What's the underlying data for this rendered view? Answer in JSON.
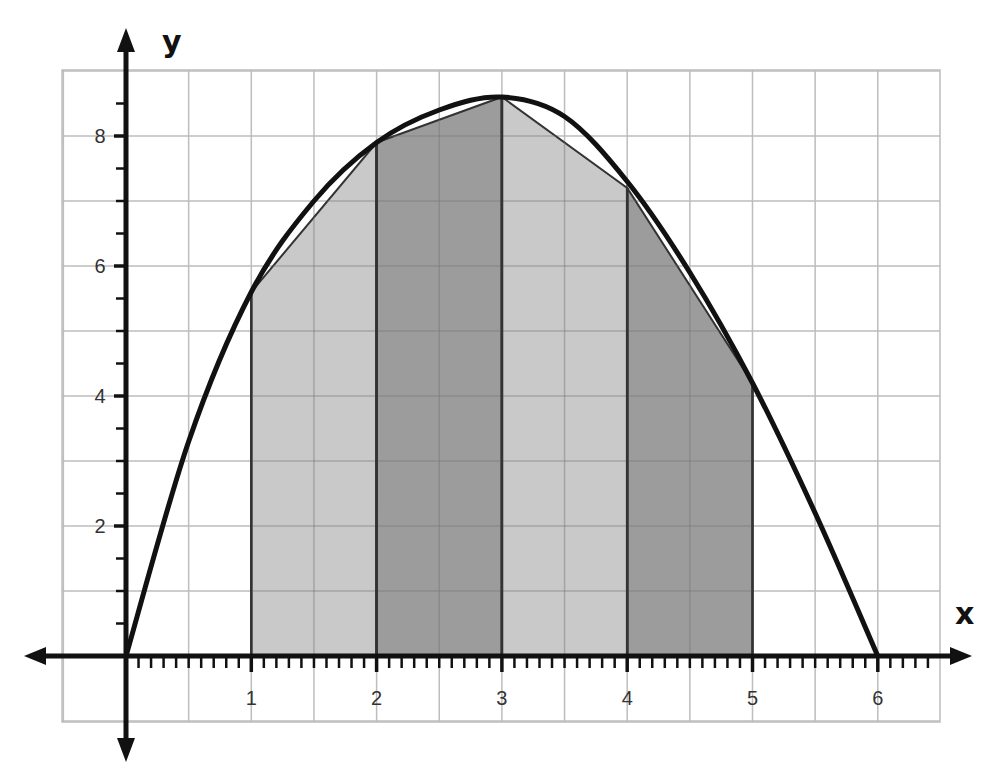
{
  "chart_data": {
    "type": "area",
    "title": "",
    "xlabel": "x",
    "ylabel": "y",
    "xlim": [
      -0.5,
      6.5
    ],
    "ylim": [
      -1,
      8.9
    ],
    "x_ticks": [
      1,
      2,
      3,
      4,
      5,
      6
    ],
    "y_ticks": [
      2,
      4,
      6,
      8
    ],
    "x_tick_labels": [
      "1",
      "2",
      "3",
      "4",
      "5",
      "6"
    ],
    "y_tick_labels": [
      "2",
      "4",
      "6",
      "8"
    ],
    "grid": true,
    "grid_spacing": {
      "x": 0.5,
      "y": 1
    },
    "minor_ticks": {
      "x": 0.1,
      "y": 0.5
    },
    "curve": {
      "name": "f(x)",
      "x": [
        0,
        0.5,
        1,
        1.5,
        2,
        2.5,
        3,
        3.5,
        4,
        4.5,
        5,
        5.5,
        6
      ],
      "y": [
        0,
        3.3,
        5.6,
        7.0,
        7.9,
        8.4,
        8.6,
        8.3,
        7.3,
        5.9,
        4.2,
        2.2,
        0
      ]
    },
    "trapezoids": [
      {
        "x0": 1,
        "x1": 2,
        "y0": 5.6,
        "y1": 7.9,
        "shade": "light"
      },
      {
        "x0": 2,
        "x1": 3,
        "y0": 7.9,
        "y1": 8.6,
        "shade": "dark"
      },
      {
        "x0": 3,
        "x1": 4,
        "y0": 8.6,
        "y1": 7.2,
        "shade": "light"
      },
      {
        "x0": 4,
        "x1": 5,
        "y0": 7.2,
        "y1": 4.2,
        "shade": "dark"
      }
    ],
    "colors": {
      "light": "#c9c9c9",
      "dark": "#9c9c9c",
      "grid": "#bdbdbd",
      "axis": "#111111",
      "curve": "#111111"
    }
  }
}
